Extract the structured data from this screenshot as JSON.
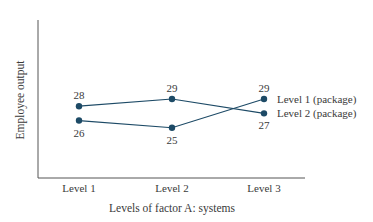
{
  "chart_data": {
    "type": "line",
    "title": "",
    "xlabel": "Levels of factor A: systems",
    "ylabel": "Employee output",
    "categories": [
      "Level 1",
      "Level 2",
      "Level 3"
    ],
    "series": [
      {
        "name": "Level 2 (package)",
        "values": [
          28,
          29,
          27
        ],
        "color": "#1d4a66"
      },
      {
        "name": "Level 1 (package)",
        "values": [
          26,
          25,
          29
        ],
        "color": "#1d4a66"
      }
    ],
    "ylim": [
      18,
      40
    ],
    "grid": false,
    "legend": "inline-right",
    "y_ticks_shown": false
  }
}
